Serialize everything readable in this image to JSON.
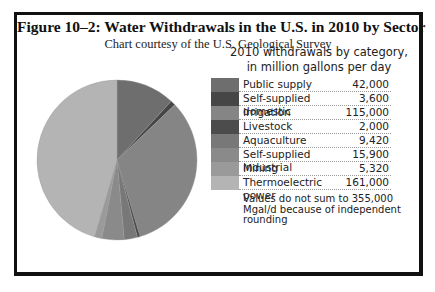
{
  "title": "Figure 10–2: Water Withdrawals in the U.S. in 2010 by Sector",
  "subtitle": "Chart courtesy of the U.S. Geological Survey",
  "chart_data": {
    "type": "pie",
    "title": "2010 withdrawals by category, in million gallons per day",
    "legend_title_line1": "2010 withdrawals by category,",
    "legend_title_line2": "in million gallons per day",
    "legend_position": "right",
    "start_angle": "12 o'clock",
    "direction": "clockwise",
    "units": "million gallons per day",
    "categories": [
      "Public supply",
      "Self-supplied domestic",
      "Irrigation",
      "Livestock",
      "Aquaculture",
      "Self-supplied industrial",
      "Mining",
      "Thermoelectric power"
    ],
    "values": [
      42000,
      3600,
      115000,
      2000,
      9420,
      15900,
      5320,
      161000
    ],
    "value_labels": [
      "42,000",
      "3,600",
      "115,000",
      "2,000",
      "9,420",
      "15,900",
      "5,320",
      "161,000"
    ],
    "colors": [
      "#6e6e6e",
      "#464646",
      "#858585",
      "#4c4c4c",
      "#787878",
      "#8a8a8a",
      "#9a9a9a",
      "#b4b4b4"
    ],
    "note": "Values do not sum to 355,000 Mgal/d because of independent rounding"
  }
}
